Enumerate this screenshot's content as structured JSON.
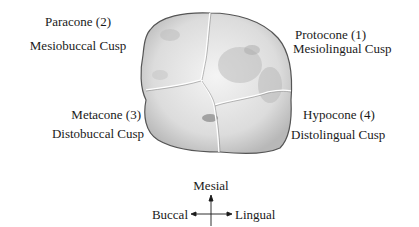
{
  "diagram": {
    "cusps": [
      {
        "name": "Paracone (2)",
        "description": "Mesiobuccal Cusp",
        "position": "upper-left"
      },
      {
        "name": "Protocone (1)",
        "description": "Mesiolingual Cusp",
        "position": "upper-right"
      },
      {
        "name": "Metacone (3)",
        "description": "Distobuccal Cusp",
        "position": "lower-left"
      },
      {
        "name": "Hypocone (4)",
        "description": "Distolingual Cusp",
        "position": "lower-right"
      }
    ],
    "orientation": {
      "up": "Mesial",
      "left": "Buccal",
      "right": "Lingual"
    },
    "colors": {
      "text": "#1a1a1a",
      "outline": "#555555",
      "shading": "#c8c8c8",
      "groove": "#ffffff"
    }
  }
}
